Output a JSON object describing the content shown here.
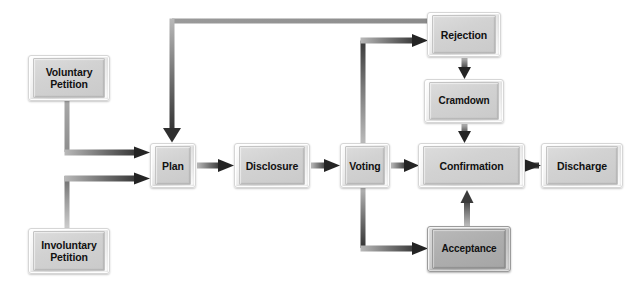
{
  "diagram": {
    "type": "flowchart",
    "background_color": "#ffffff",
    "node_fill_light": "#d4d4d4",
    "node_fill_dark": "#aeaeae",
    "edge_color": "#4a4a4a",
    "text_color": "#111111",
    "nodes": [
      {
        "id": "voluntary-petition",
        "label": "Voluntary\nPetition",
        "style": "light",
        "x": 28,
        "y": 55,
        "w": 82,
        "h": 46
      },
      {
        "id": "involuntary-petition",
        "label": "Involuntary\nPetition",
        "style": "light",
        "x": 28,
        "y": 228,
        "w": 82,
        "h": 46
      },
      {
        "id": "plan",
        "label": "Plan",
        "style": "light",
        "x": 150,
        "y": 143,
        "w": 46,
        "h": 45
      },
      {
        "id": "disclosure",
        "label": "Disclosure",
        "style": "light",
        "x": 234,
        "y": 143,
        "w": 76,
        "h": 45
      },
      {
        "id": "voting",
        "label": "Voting",
        "style": "light",
        "x": 340,
        "y": 143,
        "w": 50,
        "h": 45
      },
      {
        "id": "confirmation",
        "label": "Confirmation",
        "style": "light",
        "x": 418,
        "y": 143,
        "w": 107,
        "h": 45
      },
      {
        "id": "discharge",
        "label": "Discharge",
        "style": "light",
        "x": 541,
        "y": 143,
        "w": 82,
        "h": 45
      },
      {
        "id": "rejection",
        "label": "Rejection",
        "style": "light",
        "x": 427,
        "y": 12,
        "w": 74,
        "h": 45
      },
      {
        "id": "cramdown",
        "label": "Cramdown",
        "style": "light",
        "x": 424,
        "y": 79,
        "w": 80,
        "h": 44
      },
      {
        "id": "acceptance",
        "label": "Acceptance",
        "style": "dark",
        "x": 427,
        "y": 226,
        "w": 84,
        "h": 46
      }
    ],
    "edges": [
      {
        "id": "voluntary-to-plan",
        "from": "voluntary-petition",
        "to": "plan",
        "kind": "elbow-down-right"
      },
      {
        "id": "involuntary-to-plan",
        "from": "involuntary-petition",
        "to": "plan",
        "kind": "elbow-up-right"
      },
      {
        "id": "plan-to-disclosure",
        "from": "plan",
        "to": "disclosure",
        "kind": "straight-right"
      },
      {
        "id": "disclosure-to-voting",
        "from": "disclosure",
        "to": "voting",
        "kind": "straight-right"
      },
      {
        "id": "voting-to-confirmation",
        "from": "voting",
        "to": "confirmation",
        "kind": "straight-right"
      },
      {
        "id": "confirmation-to-discharge",
        "from": "confirmation",
        "to": "discharge",
        "kind": "straight-right"
      },
      {
        "id": "voting-to-rejection",
        "from": "voting",
        "to": "rejection",
        "kind": "elbow-up-right"
      },
      {
        "id": "voting-to-acceptance",
        "from": "voting",
        "to": "acceptance",
        "kind": "elbow-down-right"
      },
      {
        "id": "rejection-to-cramdown",
        "from": "rejection",
        "to": "cramdown",
        "kind": "straight-down"
      },
      {
        "id": "cramdown-to-confirmation",
        "from": "cramdown",
        "to": "confirmation",
        "kind": "straight-down"
      },
      {
        "id": "acceptance-to-confirmation",
        "from": "acceptance",
        "to": "confirmation",
        "kind": "straight-up"
      },
      {
        "id": "rejection-to-plan",
        "from": "rejection",
        "to": "plan",
        "kind": "feedback-top-loop"
      }
    ]
  }
}
